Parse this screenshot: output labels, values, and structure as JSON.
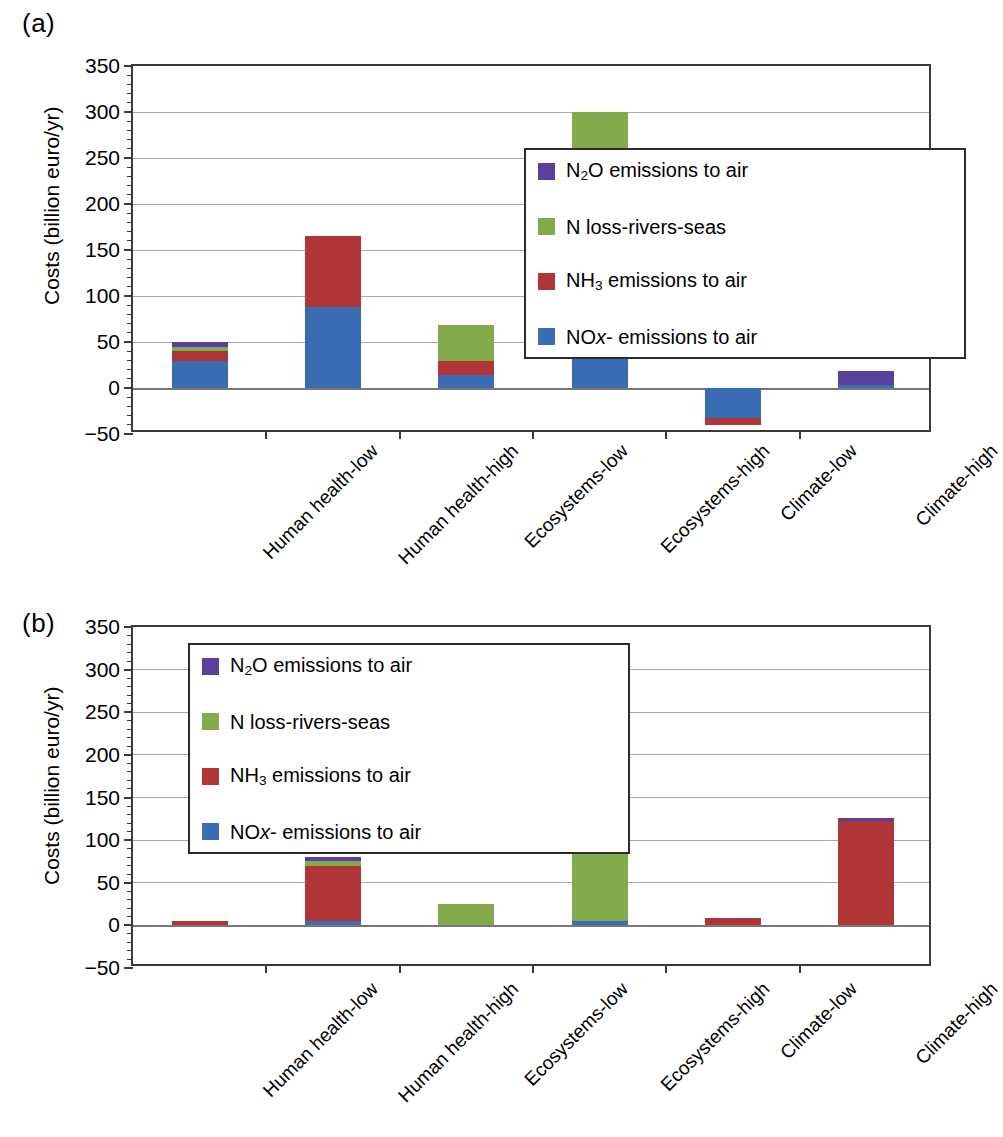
{
  "figure": {
    "panel_a_letter": "(a)",
    "panel_b_letter": "(b)"
  },
  "axis": {
    "ylabel": "Costs (billion euro/yr)",
    "yticks": [
      "350",
      "300",
      "250",
      "200",
      "150",
      "100",
      "50",
      "0",
      "−50"
    ],
    "ymin": -50,
    "ymax": 350,
    "ystep": 50
  },
  "categories": [
    "Human health-low",
    "Human health-high",
    "Ecosystems-low",
    "Ecosystems-high",
    "Climate-low",
    "Climate-high"
  ],
  "legend": {
    "items": [
      {
        "label_html": "N<sub>2</sub>O emissions to air",
        "label": "N2O emissions to air",
        "color": "#5b3f9d",
        "key": "n2o"
      },
      {
        "label_html": "N loss-rivers-seas",
        "label": "N loss-rivers-seas",
        "color": "#83ab4c",
        "key": "nloss"
      },
      {
        "label_html": "NH<sub>3</sub> emissions to air",
        "label": "NH3 emissions to air",
        "color": "#b03536",
        "key": "nh3"
      },
      {
        "label_html": "NO<span class=\"ital\">x</span>- emissions to air",
        "label": "NOx- emissions to air",
        "color": "#3a6cb4",
        "key": "nox"
      }
    ]
  },
  "colors": {
    "n2o": "#5b3f9d",
    "nloss": "#83ab4c",
    "nh3": "#b03536",
    "nox": "#3a6cb4",
    "axis": "#3a3a3a",
    "grid": "#8d8d8d",
    "background": "#ffffff"
  },
  "chart_data": [
    {
      "type": "bar",
      "id": "panel-a",
      "title": "(a)",
      "stacked": true,
      "xlabel": "",
      "ylabel": "Costs (billion euro/yr)",
      "ylim": [
        -50,
        350
      ],
      "ytick_values": [
        -50,
        0,
        50,
        100,
        150,
        200,
        250,
        300,
        350
      ],
      "grid": true,
      "legend_position": "upper right inside",
      "categories": [
        "Human health-low",
        "Human health-high",
        "Ecosystems-low",
        "Ecosystems-high",
        "Climate-low",
        "Climate-high"
      ],
      "series": [
        {
          "name": "NOx- emissions to air",
          "color": "#3a6cb4",
          "values": [
            29,
            88,
            14,
            75,
            -33,
            3
          ]
        },
        {
          "name": "NH3 emissions to air",
          "color": "#b03536",
          "values": [
            11,
            77,
            15,
            70,
            -7,
            0
          ]
        },
        {
          "name": "N loss-rivers-seas",
          "color": "#83ab4c",
          "values": [
            5,
            0,
            40,
            155,
            0,
            0
          ]
        },
        {
          "name": "N2O emissions to air",
          "color": "#5b3f9d",
          "values": [
            5,
            0,
            0,
            0,
            0,
            16
          ]
        }
      ],
      "totals": [
        50,
        165,
        69,
        300,
        -40,
        19
      ]
    },
    {
      "type": "bar",
      "id": "panel-b",
      "title": "(b)",
      "stacked": true,
      "xlabel": "",
      "ylabel": "Costs (billion euro/yr)",
      "ylim": [
        -50,
        350
      ],
      "ytick_values": [
        -50,
        0,
        50,
        100,
        150,
        200,
        250,
        300,
        350
      ],
      "grid": true,
      "legend_position": "upper left inside",
      "categories": [
        "Human health-low",
        "Human health-high",
        "Ecosystems-low",
        "Ecosystems-high",
        "Climate-low",
        "Climate-high"
      ],
      "series": [
        {
          "name": "NOx- emissions to air",
          "color": "#3a6cb4",
          "values": [
            0,
            5,
            0,
            5,
            0,
            0
          ]
        },
        {
          "name": "NH3 emissions to air",
          "color": "#b03536",
          "values": [
            5,
            65,
            0,
            0,
            9,
            122
          ]
        },
        {
          "name": "N loss-rivers-seas",
          "color": "#83ab4c",
          "values": [
            0,
            6,
            25,
            95,
            0,
            0
          ]
        },
        {
          "name": "N2O emissions to air",
          "color": "#5b3f9d",
          "values": [
            0,
            4,
            0,
            0,
            0,
            4
          ]
        }
      ],
      "totals": [
        5,
        80,
        25,
        100,
        9,
        126
      ]
    }
  ]
}
